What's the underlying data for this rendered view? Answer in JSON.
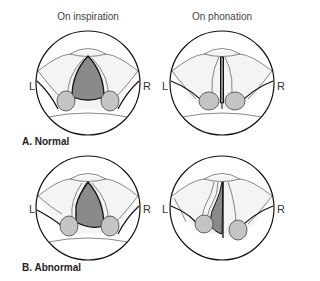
{
  "columns": {
    "left_title": "On inspiration",
    "right_title": "On phonation"
  },
  "side_labels": {
    "left": "L",
    "right": "R"
  },
  "panels": [
    {
      "label": "A. Normal"
    },
    {
      "label": "B. Abnormal"
    }
  ],
  "colors": {
    "outline": "#111111",
    "thin_line": "#555555",
    "glottis_fill": "#8a8a8a",
    "arytenoid_fill": "#c4c4c4",
    "tissue_fill": "#f4f4f4"
  }
}
